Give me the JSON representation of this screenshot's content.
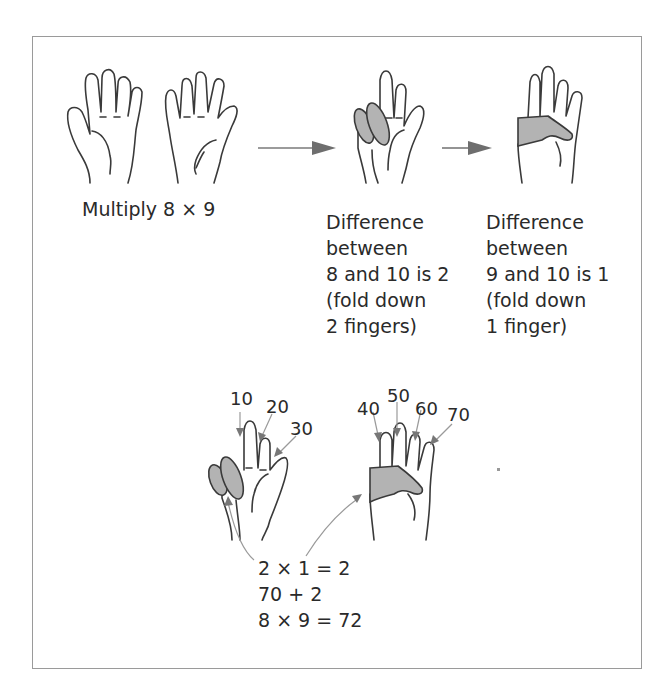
{
  "diagram": {
    "top_row": {
      "caption_multiply": "Multiply 8 × 9",
      "step1": {
        "lines": [
          "Difference",
          "between",
          "8 and 10 is 2",
          "(fold down",
          "2 fingers)"
        ]
      },
      "step2": {
        "lines": [
          "Difference",
          "between",
          "9 and 10 is 1",
          "(fold down",
          "1 finger)"
        ]
      }
    },
    "bottom_row": {
      "left_hand_labels": [
        "10",
        "20",
        "30"
      ],
      "right_hand_labels": [
        "40",
        "50",
        "60",
        "70"
      ],
      "result_lines": [
        "2 × 1 = 2",
        "70 + 2",
        "8 × 9 = 72"
      ]
    },
    "colors": {
      "frame": "#9a9a9a",
      "outline": "#3a3a3a",
      "fold_fill": "#b3b3b3",
      "arrow": "#6e6e6e"
    },
    "icons": [
      "open-hand-icon",
      "folded-fingers-hand-icon",
      "right-arrow-icon",
      "pointer-arrow-icon"
    ]
  }
}
